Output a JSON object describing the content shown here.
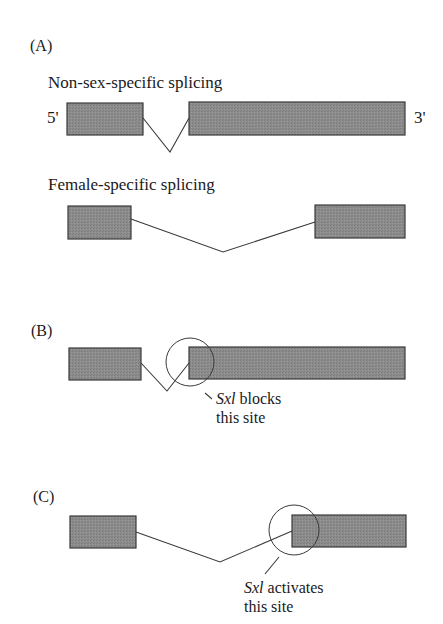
{
  "panels": [
    {
      "label": "(A)",
      "sections": [
        {
          "title": "Non-sex-specific splicing",
          "five_prime": "5'",
          "three_prime": "3'",
          "exons": [
            {
              "x": 67,
              "y": 103,
              "w": 76,
              "h": 32
            },
            {
              "x": 189,
              "y": 102,
              "w": 216,
              "h": 33
            }
          ],
          "splice_path": "143,118 170,152 189,118"
        },
        {
          "title": "Female-specific splicing",
          "exons": [
            {
              "x": 68,
              "y": 206,
              "w": 63,
              "h": 33
            },
            {
              "x": 315,
              "y": 205,
              "w": 90,
              "h": 33
            }
          ],
          "splice_path": "131,219 223,252 315,222"
        }
      ]
    },
    {
      "label": "(B)",
      "exons": [
        {
          "x": 69,
          "y": 348,
          "w": 72,
          "h": 32
        },
        {
          "x": 189,
          "y": 347,
          "w": 216,
          "h": 32
        }
      ],
      "splice_path": "141,363 167,391 189,363",
      "circle": {
        "cx": 190,
        "cy": 362,
        "r": 24
      },
      "pointer": "205,393 212,399",
      "annotation": {
        "gene": "Sxl",
        "line1_rest": " blocks",
        "line2": "this site"
      }
    },
    {
      "label": "(C)",
      "exons": [
        {
          "x": 70,
          "y": 516,
          "w": 66,
          "h": 32
        },
        {
          "x": 292,
          "y": 515,
          "w": 114,
          "h": 32
        }
      ],
      "splice_path": "136,532 220,562 292,531",
      "circle": {
        "cx": 294,
        "cy": 530,
        "r": 25
      },
      "pointer": "279,557 265,574",
      "annotation": {
        "gene": "Sxl",
        "line1_rest": " activates",
        "line2": "this site"
      }
    }
  ],
  "colors": {
    "exon_fill": "#8a8a8a",
    "stroke": "#3a3a3a",
    "text": "#1a1a1a"
  }
}
